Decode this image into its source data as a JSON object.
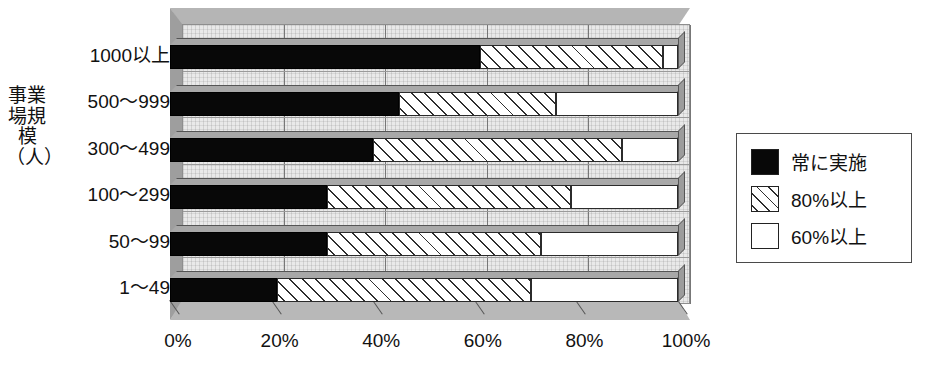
{
  "chart_data": {
    "type": "bar",
    "orientation": "horizontal",
    "stacked": true,
    "stack_mode": "percent",
    "title": "",
    "xlabel": "",
    "ylabel": "事業場規模（人）",
    "xlim": [
      0,
      100
    ],
    "xticks": [
      0,
      20,
      40,
      60,
      80,
      100
    ],
    "xticklabels": [
      "0%",
      "20%",
      "40%",
      "60%",
      "80%",
      "100%"
    ],
    "grid": true,
    "grid_axis": "x",
    "legend_position": "right",
    "categories": [
      "1000以上",
      "500～999",
      "300～499",
      "100～299",
      "50～99",
      "1～49"
    ],
    "series": [
      {
        "name": "常に実施",
        "style": "solid-black",
        "color": "#080808",
        "values": [
          61,
          45,
          40,
          31,
          31,
          21
        ]
      },
      {
        "name": "80%以上",
        "style": "diagonal-hatch",
        "color": "#ffffff",
        "values": [
          36,
          31,
          49,
          48,
          42,
          50
        ]
      },
      {
        "name": "60%以上",
        "style": "solid-white",
        "color": "#ffffff",
        "values": [
          3,
          24,
          11,
          21,
          27,
          29
        ]
      }
    ],
    "cumulative_boundaries": [
      [
        61,
        97
      ],
      [
        45,
        76
      ],
      [
        40,
        89
      ],
      [
        31,
        79
      ],
      [
        31,
        73
      ],
      [
        21,
        71
      ]
    ]
  },
  "axis": {
    "y_title": "事業場規模\n（人）",
    "category_labels": [
      "1000以上",
      "500～999",
      "300～499",
      "100～299",
      "50～99",
      "1～49"
    ],
    "x_tick_labels": [
      "0%",
      "20%",
      "40%",
      "60%",
      "80%",
      "100%"
    ]
  },
  "legend": {
    "items": [
      {
        "label": "常に実施",
        "swatch": "black"
      },
      {
        "label": "80%以上",
        "swatch": "hatch"
      },
      {
        "label": "60%以上",
        "swatch": "white"
      }
    ]
  },
  "colors": {
    "black_series": "#080808",
    "hatch_line": "#2e2e2e",
    "white_series": "#ffffff",
    "plot_background": "#e9e9e9",
    "frame_shadow": "#b5b5b5",
    "axis_line": "#555555"
  }
}
